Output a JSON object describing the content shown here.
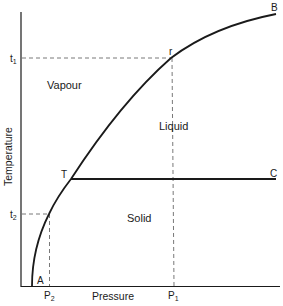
{
  "diagram": {
    "type": "phase-diagram",
    "axes": {
      "x_label": "Pressure",
      "y_label": "Temperature"
    },
    "regions": {
      "vapour": "Vapour",
      "liquid": "Liquid",
      "solid": "Solid"
    },
    "points": {
      "A": "A",
      "B": "B",
      "C": "C",
      "T": "T",
      "r": "r"
    },
    "ticks": {
      "t1": "t",
      "t1_sub": "1",
      "t2": "t",
      "t2_sub": "2",
      "P1": "P",
      "P1_sub": "1",
      "P2": "P",
      "P2_sub": "2"
    },
    "colors": {
      "line": "#1a1a1a",
      "dashed": "#555555",
      "background": "#ffffff"
    }
  }
}
